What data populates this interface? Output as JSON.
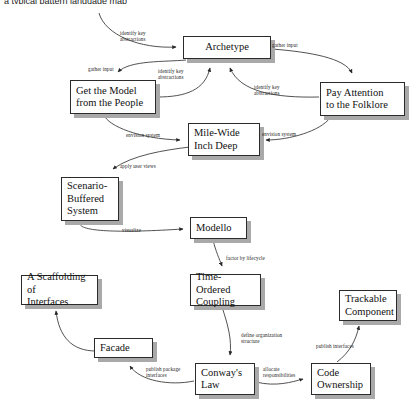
{
  "header": {
    "text": "    a typical pattern language map"
  },
  "diagram": {
    "title": "Pattern language map",
    "type": "directed-graph",
    "nodes": [
      {
        "id": "archetype",
        "label": "Archetype",
        "x": 183,
        "y": 36,
        "w": 88,
        "h": 23,
        "align": "center"
      },
      {
        "id": "get-model",
        "label": "Get the Model\nfrom the People",
        "x": 70,
        "y": 80,
        "w": 86,
        "h": 34,
        "align": "left"
      },
      {
        "id": "pay-attention",
        "label": "Pay Attention\nto the Folklore",
        "x": 320,
        "y": 82,
        "w": 85,
        "h": 34,
        "align": "left"
      },
      {
        "id": "mile-wide",
        "label": "Mile-Wide\nInch Deep",
        "x": 188,
        "y": 123,
        "w": 72,
        "h": 33,
        "align": "left"
      },
      {
        "id": "scenario",
        "label": "Scenario-\nBuffered\nSystem",
        "x": 61,
        "y": 177,
        "w": 58,
        "h": 44,
        "align": "left"
      },
      {
        "id": "modello",
        "label": "Modello",
        "x": 190,
        "y": 217,
        "w": 57,
        "h": 22,
        "align": "left"
      },
      {
        "id": "scaffolding",
        "label": "A Scaffolding of\nInterfaces",
        "x": 21,
        "y": 275,
        "w": 77,
        "h": 30,
        "align": "left"
      },
      {
        "id": "time-ordered",
        "label": "Time-Ordered\nCoupling",
        "x": 190,
        "y": 274,
        "w": 71,
        "h": 32,
        "align": "left"
      },
      {
        "id": "trackable",
        "label": "Trackable\nComponent",
        "x": 339,
        "y": 290,
        "w": 58,
        "h": 31,
        "align": "left"
      },
      {
        "id": "facade",
        "label": "Facade",
        "x": 94,
        "y": 338,
        "w": 59,
        "h": 20,
        "align": "left"
      },
      {
        "id": "conways-law",
        "label": "Conway's\nLaw",
        "x": 195,
        "y": 363,
        "w": 60,
        "h": 32,
        "align": "left"
      },
      {
        "id": "code-ownership",
        "label": "Code\nOwnership",
        "x": 311,
        "y": 363,
        "w": 60,
        "h": 32,
        "align": "left"
      }
    ],
    "edges": [
      {
        "id": "e1",
        "from": "offscreen-top",
        "to": "archetype",
        "label": "identify key\nabstractions",
        "label_x": 120,
        "label_y": 30
      },
      {
        "id": "e2",
        "from": "archetype",
        "to": "pay-attention",
        "label": "gather input",
        "label_x": 272,
        "label_y": 42
      },
      {
        "id": "e3",
        "from": "archetype",
        "to": "get-model",
        "label": "gather input",
        "label_x": 88,
        "label_y": 66
      },
      {
        "id": "e4",
        "from": "get-model",
        "to": "archetype",
        "label": "identify key\nabstractions",
        "label_x": 158,
        "label_y": 68
      },
      {
        "id": "e5",
        "from": "pay-attention",
        "to": "archetype",
        "label": "identify key\nabstractions",
        "label_x": 254,
        "label_y": 84
      },
      {
        "id": "e6",
        "from": "get-model",
        "to": "mile-wide",
        "label": "envision system",
        "label_x": 126,
        "label_y": 132
      },
      {
        "id": "e7",
        "from": "pay-attention",
        "to": "mile-wide",
        "label": "envision system",
        "label_x": 262,
        "label_y": 131
      },
      {
        "id": "e8",
        "from": "mile-wide",
        "to": "scenario",
        "label": "apply user views",
        "label_x": 120,
        "label_y": 163
      },
      {
        "id": "e9",
        "from": "scenario",
        "to": "modello",
        "label": "visualize",
        "label_x": 122,
        "label_y": 227
      },
      {
        "id": "e10",
        "from": "modello",
        "to": "time-ordered",
        "label": "factor by lifecycle",
        "label_x": 226,
        "label_y": 255
      },
      {
        "id": "e11",
        "from": "time-ordered",
        "to": "conways-law",
        "label": "define organization\nstructure",
        "label_x": 241,
        "label_y": 332
      },
      {
        "id": "e12",
        "from": "conways-law",
        "to": "facade",
        "label": "publish package\ninterfaces",
        "label_x": 146,
        "label_y": 366
      },
      {
        "id": "e13",
        "from": "facade",
        "to": "scaffolding",
        "label": "",
        "label_x": 0,
        "label_y": 0
      },
      {
        "id": "e14",
        "from": "conways-law",
        "to": "code-ownership",
        "label": "allocate\nresponsibilities",
        "label_x": 263,
        "label_y": 366
      },
      {
        "id": "e15",
        "from": "code-ownership",
        "to": "trackable",
        "label": "publish interfaces",
        "label_x": 316,
        "label_y": 343
      }
    ],
    "style": {
      "node_fill": "#ffffff",
      "node_border": "#2b2b2b",
      "node_shadow": "#a9a9a9",
      "edge_color": "#333333",
      "text_color": "#111111",
      "background": "#ffffff"
    }
  }
}
